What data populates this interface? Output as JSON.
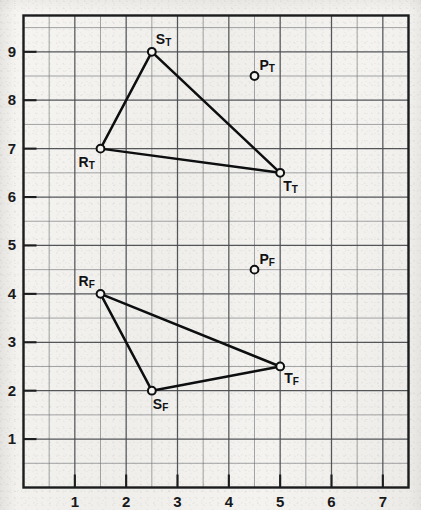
{
  "chart_data": {
    "type": "scatter",
    "title": "",
    "xlabel": "",
    "ylabel": "",
    "xlim": [
      0,
      7.5
    ],
    "ylim": [
      0,
      9.75
    ],
    "grid": true,
    "grid_step": 0.5,
    "legend": "none",
    "xticks": [
      "1",
      "2",
      "3",
      "4",
      "5",
      "6",
      "7"
    ],
    "xtick_values": [
      1,
      2,
      3,
      4,
      5,
      6,
      7
    ],
    "yticks": [
      "1",
      "2",
      "3",
      "4",
      "5",
      "6",
      "7",
      "8",
      "9"
    ],
    "ytick_values": [
      1,
      2,
      3,
      4,
      5,
      6,
      7,
      8,
      9
    ],
    "series": [
      {
        "name": "Triangle T",
        "closed": true,
        "points": [
          {
            "label": "R",
            "sub": "T",
            "x": 1.5,
            "y": 7.0,
            "label_dx": -22,
            "label_dy": 6
          },
          {
            "label": "S",
            "sub": "T",
            "x": 2.5,
            "y": 9.0,
            "label_dx": 4,
            "label_dy": -20
          },
          {
            "label": "T",
            "sub": "T",
            "x": 5.0,
            "y": 6.5,
            "label_dx": 3,
            "label_dy": 6
          }
        ]
      },
      {
        "name": "Triangle F",
        "closed": true,
        "points": [
          {
            "label": "R",
            "sub": "F",
            "x": 1.5,
            "y": 4.0,
            "label_dx": -22,
            "label_dy": -20
          },
          {
            "label": "S",
            "sub": "F",
            "x": 2.5,
            "y": 2.0,
            "label_dx": 1,
            "label_dy": 6
          },
          {
            "label": "T",
            "sub": "F",
            "x": 5.0,
            "y": 2.5,
            "label_dx": 4,
            "label_dy": 5
          }
        ]
      }
    ],
    "isolated_points": [
      {
        "label": "P",
        "sub": "T",
        "x": 4.5,
        "y": 8.5,
        "label_dx": 5,
        "label_dy": -18
      },
      {
        "label": "P",
        "sub": "F",
        "x": 4.5,
        "y": 4.5,
        "label_dx": 5,
        "label_dy": -18
      }
    ],
    "colors": {
      "grid_minor": "#6d6f73",
      "grid_major": "#4a4c50",
      "border": "#1b1c1e",
      "line": "#0d0e10",
      "marker_fill": "#f4f3f0",
      "marker_stroke": "#0d0e10",
      "text": "#17181a",
      "paper": "#f3f2ef"
    }
  }
}
